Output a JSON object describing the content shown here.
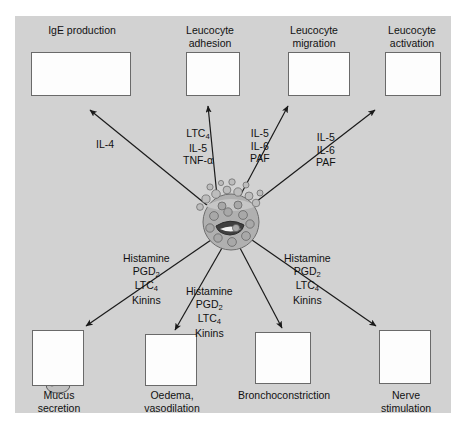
{
  "figure": {
    "type": "biological-pathway-diagram",
    "center_cell": "degranulating-mast-cell",
    "background_color": "#d2d2d2",
    "panel_color": "#fdfdfd",
    "border_color": "#6a6a6a"
  },
  "top_outcomes": [
    {
      "id": "ige-production",
      "caption": "IgE production",
      "icon": "two-lymphocytes-producing-antibody",
      "mediators": [
        "IL-4"
      ]
    },
    {
      "id": "leucocyte-adhesion",
      "caption": "Leucocyte\nadhesion",
      "icon": "leucocyte-adhering-to-endothelium",
      "mediators": [
        "LTC4",
        "IL-5",
        "TNF-alpha"
      ]
    },
    {
      "id": "leucocyte-migration",
      "caption": "Leucocyte\nmigration",
      "icon": "three-migrating-leucocytes",
      "mediators": [
        "IL-5",
        "IL-6",
        "PAF"
      ]
    },
    {
      "id": "leucocyte-activation",
      "caption": "Leucocyte\nactivation",
      "icon": "activated-leucocyte-releasing-granules",
      "mediators": [
        "IL-5",
        "IL-6",
        "PAF"
      ]
    }
  ],
  "bottom_outcomes": [
    {
      "id": "mucus-secretion",
      "caption": "Mucus\nsecretion",
      "icon": "mucus-gland",
      "mediators": [
        "Histamine",
        "PGD2",
        "LTC4",
        "Kinins"
      ]
    },
    {
      "id": "oedema-vasodilation",
      "caption": "Oedema,\nvasodilation",
      "icon": "dilated-blood-vessel",
      "mediators": [
        "Histamine",
        "PGD2",
        "LTC4",
        "Kinins"
      ]
    },
    {
      "id": "bronchoconstriction",
      "caption": "Bronchoconstriction",
      "icon": "smooth-muscle-bundle",
      "mediators": [
        "Histamine",
        "PGD2",
        "LTC4",
        "Kinins"
      ]
    },
    {
      "id": "nerve-stimulation",
      "caption": "Nerve\nstimulation",
      "icon": "branching-nerve-fibre",
      "mediators": [
        "Histamine",
        "PGD2",
        "LTC4",
        "Kinins"
      ]
    }
  ],
  "mediator_labels": {
    "il4": {
      "line1": "IL-4"
    },
    "adhesion": {
      "line1": "LTC",
      "sub1": "4",
      "line2": "IL-5",
      "line3": "TNF-",
      "greek3": "α"
    },
    "migration": {
      "line1": "IL-5",
      "line2": "IL-6",
      "line3": "PAF"
    },
    "activation": {
      "line1": "IL-5",
      "line2": "IL-6",
      "line3": "PAF"
    },
    "mucus": {
      "line1": "Histamine",
      "line2": "PGD",
      "sub2": "2",
      "line3": "LTC",
      "sub3": "4",
      "line4": "Kinins"
    },
    "middle": {
      "line1": "Histamine",
      "line2": "PGD",
      "sub2": "2",
      "line3": "LTC",
      "sub3": "4",
      "line4": "Kinins"
    },
    "nerve": {
      "line1": "Histamine",
      "line2": "PGD",
      "sub2": "2",
      "line3": "LTC",
      "sub3": "4",
      "line4": "Kinins"
    }
  }
}
